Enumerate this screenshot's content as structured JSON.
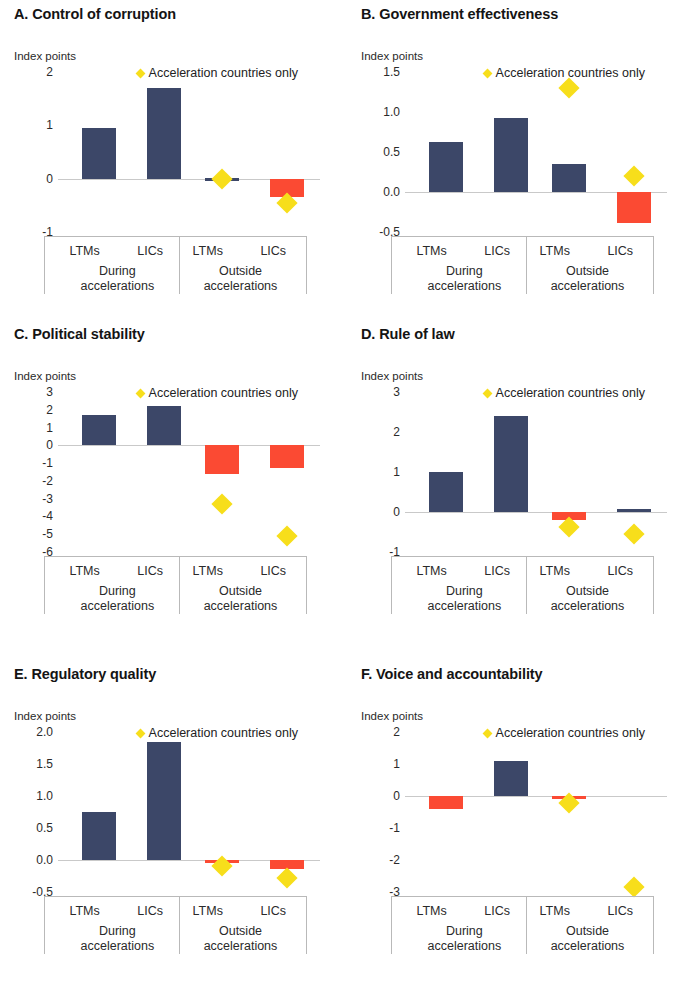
{
  "figure": {
    "axis_unit_label": "Index points",
    "legend_label": "Acceleration countries only",
    "legend_marker_icon": "yellow-diamond-icon",
    "category_labels": [
      "LTMs",
      "LICs",
      "LTMs",
      "LICs"
    ],
    "group_labels": [
      "During\naccelerations",
      "Outside\naccelerations"
    ],
    "group_label_line1": [
      "During",
      "Outside"
    ],
    "group_label_line2": [
      "accelerations",
      "accelerations"
    ],
    "colors": {
      "positive_bar": "#3c4768",
      "negative_bar": "#fb4a33",
      "diamond": "#f7de1b",
      "axis_line": "#c9c9c9",
      "text": "#2a2a2a"
    }
  },
  "chart_data": [
    {
      "type": "bar",
      "panel": "A",
      "title": "A. Control of corruption",
      "ylabel": "Index points",
      "xlabel": "",
      "categories": [
        "LTMs",
        "LICs",
        "LTMs",
        "LICs"
      ],
      "groups": [
        "During accelerations",
        "During accelerations",
        "Outside accelerations",
        "Outside accelerations"
      ],
      "values": [
        0.95,
        1.7,
        0.02,
        -0.35
      ],
      "series": [
        {
          "name": "All countries",
          "values": [
            0.95,
            1.7,
            0.02,
            -0.35
          ]
        },
        {
          "name": "Acceleration countries only",
          "values": [
            null,
            null,
            0.0,
            -0.45
          ]
        }
      ],
      "yticks": [
        2,
        1,
        0,
        -1
      ],
      "ytick_labels": [
        "2",
        "1",
        "0",
        "-1"
      ],
      "ylim": [
        -1,
        2
      ],
      "grid": false,
      "legend_position": "top-center"
    },
    {
      "type": "bar",
      "panel": "B",
      "title": "B. Government effectiveness",
      "ylabel": "Index points",
      "xlabel": "",
      "categories": [
        "LTMs",
        "LICs",
        "LTMs",
        "LICs"
      ],
      "groups": [
        "During accelerations",
        "During accelerations",
        "Outside accelerations",
        "Outside accelerations"
      ],
      "values": [
        0.62,
        0.93,
        0.35,
        -0.39
      ],
      "series": [
        {
          "name": "All countries",
          "values": [
            0.62,
            0.93,
            0.35,
            -0.39
          ]
        },
        {
          "name": "Acceleration countries only",
          "values": [
            null,
            null,
            1.3,
            0.2
          ]
        }
      ],
      "yticks": [
        1.5,
        1.0,
        0.5,
        0.0,
        -0.5
      ],
      "ytick_labels": [
        "1.5",
        "1.0",
        "0.5",
        "0.0",
        "-0.5"
      ],
      "ylim": [
        -0.5,
        1.5
      ],
      "grid": false,
      "legend_position": "top-center"
    },
    {
      "type": "bar",
      "panel": "C",
      "title": "C. Political stability",
      "ylabel": "Index points",
      "xlabel": "",
      "categories": [
        "LTMs",
        "LICs",
        "LTMs",
        "LICs"
      ],
      "groups": [
        "During accelerations",
        "During accelerations",
        "Outside accelerations",
        "Outside accelerations"
      ],
      "values": [
        1.7,
        2.2,
        -1.6,
        -1.3
      ],
      "series": [
        {
          "name": "All countries",
          "values": [
            1.7,
            2.2,
            -1.6,
            -1.3
          ]
        },
        {
          "name": "Acceleration countries only",
          "values": [
            null,
            null,
            -3.3,
            -5.1
          ]
        }
      ],
      "yticks": [
        3,
        2,
        1,
        0,
        -1,
        -2,
        -3,
        -4,
        -5,
        -6
      ],
      "ytick_labels": [
        "3",
        "2",
        "1",
        "0",
        "-1",
        "-2",
        "-3",
        "-4",
        "-5",
        "-6"
      ],
      "ylim": [
        -6,
        3
      ],
      "grid": false,
      "legend_position": "top-center"
    },
    {
      "type": "bar",
      "panel": "D",
      "title": "D. Rule of law",
      "ylabel": "Index points",
      "xlabel": "",
      "categories": [
        "LTMs",
        "LICs",
        "LTMs",
        "LICs"
      ],
      "groups": [
        "During accelerations",
        "During accelerations",
        "Outside accelerations",
        "Outside accelerations"
      ],
      "values": [
        1.0,
        2.4,
        -0.2,
        0.08
      ],
      "series": [
        {
          "name": "All countries",
          "values": [
            1.0,
            2.4,
            -0.2,
            0.08
          ]
        },
        {
          "name": "Acceleration countries only",
          "values": [
            null,
            null,
            -0.38,
            -0.55
          ]
        }
      ],
      "yticks": [
        3,
        2,
        1,
        0,
        -1
      ],
      "ytick_labels": [
        "3",
        "2",
        "1",
        "0",
        "-1"
      ],
      "ylim": [
        -1,
        3
      ],
      "grid": false,
      "legend_position": "top-center"
    },
    {
      "type": "bar",
      "panel": "E",
      "title": "E. Regulatory quality",
      "ylabel": "Index points",
      "xlabel": "",
      "categories": [
        "LTMs",
        "LICs",
        "LTMs",
        "LICs"
      ],
      "groups": [
        "During accelerations",
        "During accelerations",
        "Outside accelerations",
        "Outside accelerations"
      ],
      "values": [
        0.75,
        1.85,
        -0.04,
        -0.14
      ],
      "series": [
        {
          "name": "All countries",
          "values": [
            0.75,
            1.85,
            -0.04,
            -0.14
          ]
        },
        {
          "name": "Acceleration countries only",
          "values": [
            null,
            null,
            -0.1,
            -0.28
          ]
        }
      ],
      "yticks": [
        2.0,
        1.5,
        1.0,
        0.5,
        0.0,
        -0.5
      ],
      "ytick_labels": [
        "2.0",
        "1.5",
        "1.0",
        "0.5",
        "0.0",
        "-0.5"
      ],
      "ylim": [
        -0.5,
        2.0
      ],
      "grid": false,
      "legend_position": "top-center"
    },
    {
      "type": "bar",
      "panel": "F",
      "title": "F. Voice and accountability",
      "ylabel": "Index points",
      "xlabel": "",
      "categories": [
        "LTMs",
        "LICs",
        "LTMs",
        "LICs"
      ],
      "groups": [
        "During accelerations",
        "During accelerations",
        "Outside accelerations",
        "Outside accelerations"
      ],
      "values": [
        -0.4,
        1.1,
        -0.1,
        0
      ],
      "series": [
        {
          "name": "All countries",
          "values": [
            -0.4,
            1.1,
            -0.1,
            0
          ]
        },
        {
          "name": "Acceleration countries only",
          "values": [
            null,
            null,
            -0.22,
            -2.85
          ]
        }
      ],
      "yticks": [
        2,
        1,
        0,
        -1,
        -2,
        -3
      ],
      "ytick_labels": [
        "2",
        "1",
        "0",
        "-1",
        "-2",
        "-3"
      ],
      "ylim": [
        -3,
        2
      ],
      "grid": false,
      "legend_position": "top-center"
    }
  ]
}
